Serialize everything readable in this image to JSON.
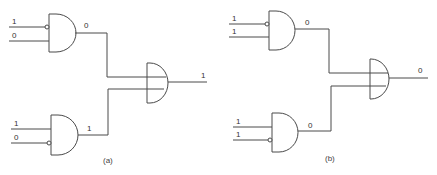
{
  "diagram": {
    "type": "logic-circuit",
    "circuits": [
      {
        "id": "a",
        "caption": "(a)",
        "top_gate": {
          "type": "AND",
          "inputs": [
            {
              "value": "1",
              "inverted": true
            },
            {
              "value": "0",
              "inverted": false
            }
          ],
          "output": "0"
        },
        "bottom_gate": {
          "type": "AND",
          "inputs": [
            {
              "value": "1",
              "inverted": false
            },
            {
              "value": "0",
              "inverted": true
            }
          ],
          "output": "1"
        },
        "final_gate": {
          "type": "AND-like (with crossing lines)",
          "output": "1"
        }
      },
      {
        "id": "b",
        "caption": "(b)",
        "top_gate": {
          "type": "AND",
          "inputs": [
            {
              "value": "1",
              "inverted": true
            },
            {
              "value": "1",
              "inverted": false
            }
          ],
          "output": "0"
        },
        "bottom_gate": {
          "type": "AND",
          "inputs": [
            {
              "value": "1",
              "inverted": false
            },
            {
              "value": "1",
              "inverted": true
            }
          ],
          "output": "0"
        },
        "final_gate": {
          "type": "AND-like (with crossing lines)",
          "output": "0"
        }
      }
    ]
  }
}
